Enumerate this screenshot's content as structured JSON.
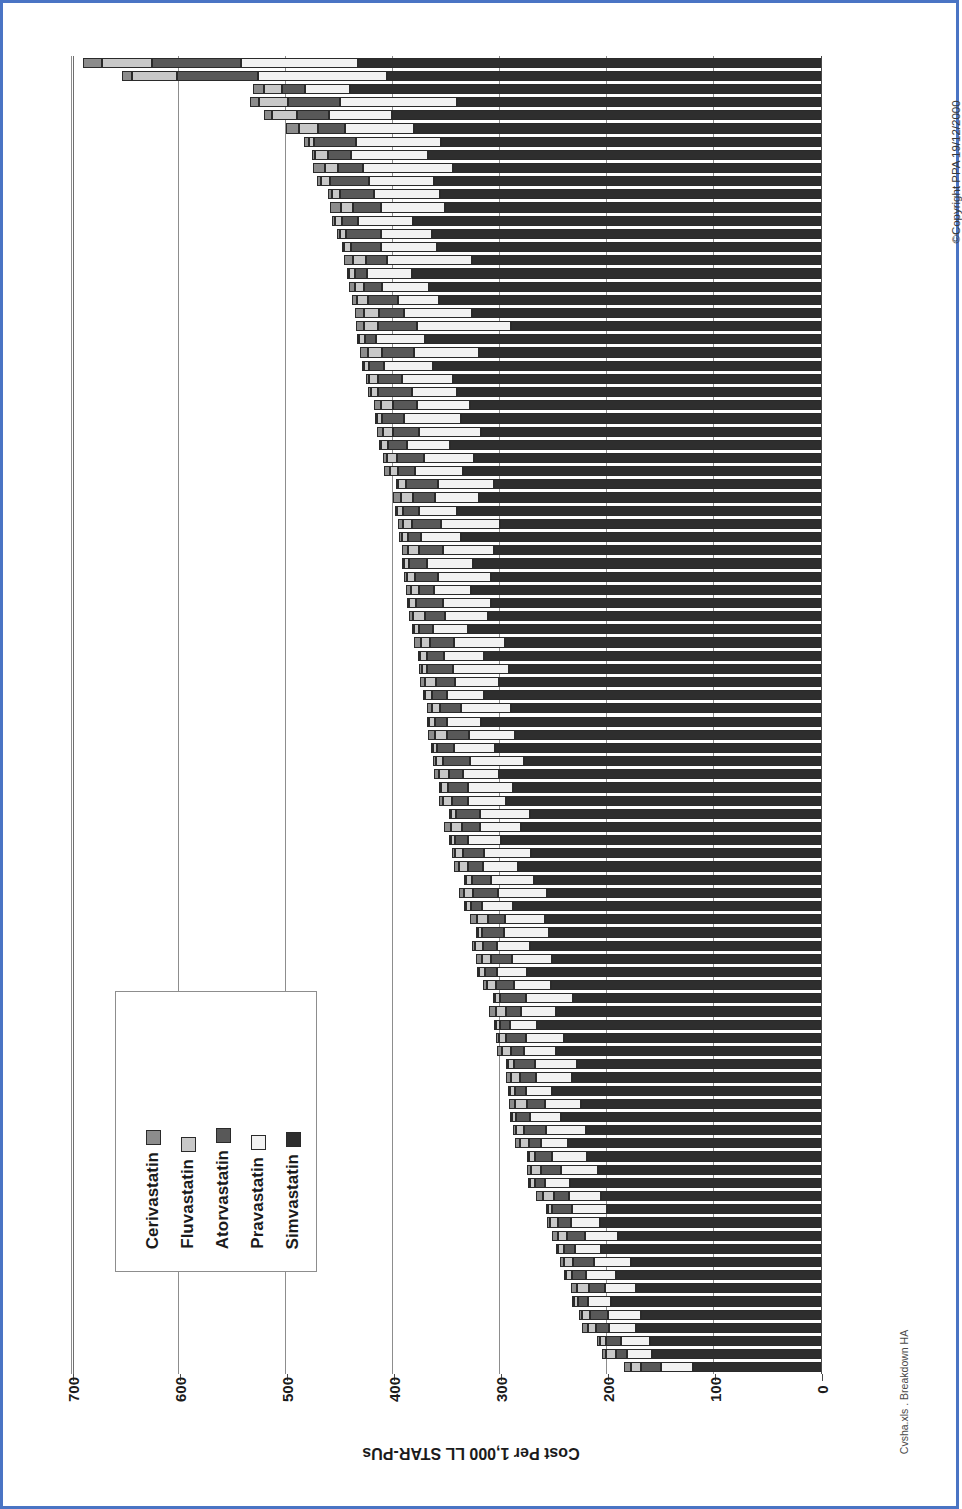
{
  "document": {
    "border_color": "#4a74c4",
    "background": "#ffffff"
  },
  "chart": {
    "title": "Variation Between Health Authorities in Statins Spending (Qtr to September 1997)",
    "category_axis_title": "The 100 Health Authorities of England",
    "value_axis_title": "Cost Per 1,000 LL STAR-PUs",
    "copyright": "©Copyright PPA 19/12/2000",
    "source_note": "Cvsha.xls . Breakdown HA"
  },
  "chart_data": {
    "type": "bar",
    "orientation": "horizontal-stacked",
    "title": "Variation Between Health Authorities in Statins Spending (Qtr to September 1997)",
    "xlabel": "Cost Per 1,000 LL STAR-PUs",
    "ylabel": "The 100 Health Authorities of England",
    "xlim": [
      0,
      700
    ],
    "xticks": [
      700,
      600,
      500,
      400,
      300,
      200,
      100,
      0
    ],
    "xtick_labels": [
      "700",
      "600",
      "500",
      "400",
      "300",
      "200",
      "100",
      "0"
    ],
    "grid": true,
    "grid_axis": "x",
    "legend_position": "inside-lower-left",
    "categories_count": 100,
    "categories_labelled": false,
    "series": [
      {
        "name": "Cerivastatin",
        "color": "#8c8c8c",
        "order": 1
      },
      {
        "name": "Fluvastatin",
        "color": "#c8c8c8",
        "order": 2
      },
      {
        "name": "Atorvastatin",
        "color": "#585858",
        "order": 3
      },
      {
        "name": "Pravastatin",
        "color": "#f2f2f2",
        "order": 4
      },
      {
        "name": "Simvastatin",
        "color": "#2e2e2e",
        "order": 5
      }
    ],
    "stacks": [
      [
        18,
        47,
        83,
        109,
        433
      ],
      [
        9,
        42,
        76,
        120,
        406
      ],
      [
        10,
        17,
        22,
        42,
        440
      ],
      [
        9,
        27,
        48,
        110,
        340
      ],
      [
        8,
        23,
        30,
        59,
        401
      ],
      [
        12,
        18,
        25,
        65,
        380
      ],
      [
        4,
        5,
        39,
        80,
        355
      ],
      [
        3,
        12,
        22,
        72,
        367
      ],
      [
        11,
        13,
        23,
        84,
        344
      ],
      [
        4,
        8,
        37,
        60,
        362
      ],
      [
        4,
        7,
        32,
        62,
        356
      ],
      [
        10,
        12,
        26,
        60,
        351
      ],
      [
        3,
        6,
        15,
        52,
        381
      ],
      [
        2,
        6,
        33,
        47,
        364
      ],
      [
        2,
        7,
        28,
        52,
        359
      ],
      [
        9,
        12,
        19,
        80,
        326
      ],
      [
        2,
        5,
        12,
        42,
        382
      ],
      [
        5,
        9,
        17,
        44,
        366
      ],
      [
        4,
        11,
        28,
        38,
        357
      ],
      [
        9,
        14,
        23,
        64,
        326
      ],
      [
        8,
        13,
        36,
        88,
        290
      ],
      [
        2,
        6,
        10,
        46,
        370
      ],
      [
        8,
        13,
        30,
        60,
        320
      ],
      [
        1,
        5,
        14,
        45,
        363
      ],
      [
        3,
        8,
        22,
        48,
        344
      ],
      [
        2,
        7,
        32,
        42,
        340
      ],
      [
        7,
        11,
        22,
        50,
        328
      ],
      [
        2,
        5,
        20,
        54,
        336
      ],
      [
        6,
        9,
        24,
        58,
        318
      ],
      [
        1,
        6,
        18,
        40,
        347
      ],
      [
        3,
        10,
        25,
        47,
        324
      ],
      [
        5,
        8,
        16,
        44,
        335
      ],
      [
        2,
        7,
        30,
        52,
        306
      ],
      [
        7,
        12,
        20,
        41,
        320
      ],
      [
        2,
        5,
        15,
        36,
        340
      ],
      [
        4,
        9,
        27,
        55,
        300
      ],
      [
        2,
        6,
        12,
        38,
        336
      ],
      [
        6,
        10,
        23,
        47,
        306
      ],
      [
        1,
        5,
        17,
        43,
        325
      ],
      [
        3,
        8,
        21,
        50,
        308
      ],
      [
        5,
        7,
        14,
        35,
        327
      ],
      [
        2,
        6,
        26,
        45,
        308
      ],
      [
        4,
        11,
        19,
        40,
        311
      ],
      [
        1,
        4,
        13,
        33,
        330
      ],
      [
        6,
        9,
        22,
        48,
        295
      ],
      [
        2,
        7,
        16,
        37,
        315
      ],
      [
        3,
        5,
        24,
        52,
        292
      ],
      [
        5,
        10,
        18,
        41,
        301
      ],
      [
        1,
        6,
        14,
        35,
        315
      ],
      [
        4,
        8,
        20,
        46,
        290
      ],
      [
        2,
        5,
        11,
        32,
        318
      ],
      [
        6,
        11,
        21,
        43,
        286
      ],
      [
        1,
        4,
        16,
        38,
        305
      ],
      [
        3,
        7,
        25,
        50,
        278
      ],
      [
        5,
        9,
        13,
        34,
        301
      ],
      [
        2,
        6,
        19,
        42,
        288
      ],
      [
        4,
        8,
        15,
        36,
        294
      ],
      [
        1,
        5,
        22,
        47,
        272
      ],
      [
        6,
        10,
        17,
        39,
        280
      ],
      [
        2,
        4,
        12,
        31,
        299
      ],
      [
        3,
        7,
        20,
        44,
        271
      ],
      [
        5,
        8,
        14,
        33,
        283
      ],
      [
        1,
        6,
        18,
        40,
        268
      ],
      [
        4,
        9,
        23,
        46,
        256
      ],
      [
        2,
        5,
        10,
        29,
        288
      ],
      [
        6,
        11,
        16,
        37,
        258
      ],
      [
        1,
        4,
        21,
        42,
        254
      ],
      [
        3,
        7,
        13,
        31,
        272
      ],
      [
        5,
        9,
        19,
        38,
        251
      ],
      [
        2,
        6,
        11,
        28,
        275
      ],
      [
        4,
        8,
        17,
        35,
        252
      ],
      [
        1,
        5,
        24,
        44,
        232
      ],
      [
        6,
        10,
        14,
        32,
        248
      ],
      [
        2,
        4,
        9,
        26,
        265
      ],
      [
        3,
        7,
        18,
        36,
        240
      ],
      [
        5,
        8,
        12,
        30,
        248
      ],
      [
        1,
        6,
        20,
        39,
        228
      ],
      [
        4,
        9,
        15,
        33,
        233
      ],
      [
        2,
        5,
        10,
        25,
        251
      ],
      [
        6,
        11,
        17,
        34,
        224
      ],
      [
        1,
        4,
        13,
        29,
        243
      ],
      [
        3,
        7,
        21,
        37,
        220
      ],
      [
        5,
        8,
        11,
        26,
        236
      ],
      [
        2,
        6,
        16,
        32,
        219
      ],
      [
        4,
        9,
        19,
        35,
        208
      ],
      [
        1,
        5,
        9,
        23,
        235
      ],
      [
        6,
        10,
        14,
        30,
        206
      ],
      [
        2,
        4,
        18,
        33,
        200
      ],
      [
        3,
        7,
        12,
        27,
        207
      ],
      [
        5,
        9,
        16,
        31,
        190
      ],
      [
        1,
        6,
        10,
        24,
        206
      ],
      [
        4,
        8,
        20,
        34,
        178
      ],
      [
        2,
        5,
        13,
        28,
        192
      ],
      [
        6,
        11,
        15,
        29,
        173
      ],
      [
        1,
        4,
        9,
        22,
        196
      ],
      [
        3,
        7,
        17,
        31,
        168
      ],
      [
        5,
        8,
        12,
        25,
        173
      ],
      [
        2,
        6,
        14,
        27,
        160
      ],
      [
        4,
        9,
        11,
        23,
        158
      ],
      [
        6,
        10,
        18,
        30,
        120
      ]
    ]
  },
  "legend": {
    "items": [
      {
        "label": "Cerivastatin",
        "color": "#8c8c8c"
      },
      {
        "label": "Fluvastatin",
        "color": "#c8c8c8"
      },
      {
        "label": "Atorvastatin",
        "color": "#585858"
      },
      {
        "label": "Pravastatin",
        "color": "#f2f2f2"
      },
      {
        "label": "Simvastatin",
        "color": "#2e2e2e"
      }
    ]
  }
}
